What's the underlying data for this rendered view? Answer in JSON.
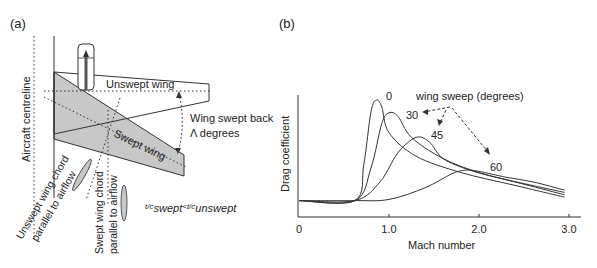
{
  "panel_a": {
    "label": "(a)",
    "centreline_label": "Aircraft centreline",
    "unswept_label": "Unswept wing",
    "swept_label": "Swept wing",
    "sweep_angle_line1": "Wing swept back",
    "sweep_angle_line2": "Λ degrees",
    "unswept_chord_line1": "Unswept wing chord",
    "unswept_chord_line2": "parallel to airflow",
    "swept_chord_line1": "Swept wing chord",
    "swept_chord_line2": "parallel to airflow",
    "tc_relation": {
      "tc1": "t/c",
      "sub1": "swept",
      "op": "<",
      "tc2": "t/c",
      "sub2": "unswept"
    },
    "colors": {
      "swept_fill": "#c8c8c8",
      "line": "#333333"
    }
  },
  "panel_b": {
    "label": "(b)",
    "legend_title": "wing sweep (degrees)",
    "curve_labels": [
      "0",
      "30",
      "45",
      "60"
    ]
  },
  "chart_data": {
    "type": "line",
    "title": "",
    "xlabel": "Mach number",
    "ylabel": "Drag coefficient",
    "xlim": [
      0,
      3.0
    ],
    "ylim": [
      0,
      1.1
    ],
    "xticks": [
      "0",
      "1.0",
      "2.0",
      "3.0"
    ],
    "yticks": [],
    "grid": false,
    "legend": "wing sweep (degrees)",
    "y_units": "relative (no tick values shown)",
    "series": [
      {
        "name": "0",
        "x": [
          0,
          0.62,
          0.72,
          0.8,
          0.86,
          0.92,
          1.0,
          1.3,
          1.8,
          2.4,
          2.95
        ],
        "y": [
          0.14,
          0.14,
          0.45,
          0.9,
          1.0,
          0.94,
          0.72,
          0.52,
          0.38,
          0.27,
          0.17
        ]
      },
      {
        "name": "30",
        "x": [
          0,
          0.62,
          0.8,
          0.92,
          1.0,
          1.1,
          1.25,
          1.6,
          2.0,
          2.5,
          2.95
        ],
        "y": [
          0.14,
          0.14,
          0.42,
          0.8,
          0.89,
          0.86,
          0.68,
          0.5,
          0.38,
          0.28,
          0.19
        ]
      },
      {
        "name": "45",
        "x": [
          0,
          0.62,
          0.9,
          1.1,
          1.3,
          1.45,
          1.6,
          1.9,
          2.3,
          2.95
        ],
        "y": [
          0.14,
          0.14,
          0.3,
          0.55,
          0.68,
          0.64,
          0.5,
          0.4,
          0.32,
          0.21
        ]
      },
      {
        "name": "60",
        "x": [
          0,
          0.62,
          1.0,
          1.4,
          1.7,
          1.85,
          2.0,
          2.3,
          2.6,
          2.95
        ],
        "y": [
          0.14,
          0.14,
          0.15,
          0.25,
          0.37,
          0.4,
          0.39,
          0.34,
          0.3,
          0.23
        ]
      }
    ]
  }
}
